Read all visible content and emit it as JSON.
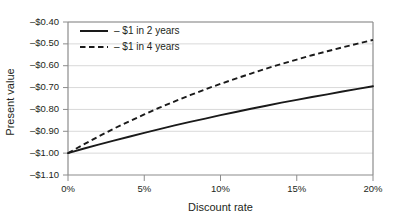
{
  "chart_data": {
    "type": "line",
    "title": "",
    "xlabel": "Discount rate",
    "ylabel": "Present value",
    "xlim": [
      0,
      20
    ],
    "ylim": [
      -1.1,
      -0.4
    ],
    "grid": true,
    "legend_position": "top-left",
    "xticks": [
      0,
      5,
      10,
      15,
      20
    ],
    "xticklabels": [
      "0%",
      "5%",
      "10%",
      "15%",
      "20%"
    ],
    "yticks": [
      -0.4,
      -0.5,
      -0.6,
      -0.7,
      -0.8,
      -0.9,
      -1.0,
      -1.1
    ],
    "yticklabels": [
      "–$0.40",
      "–$0.50",
      "–$0.60",
      "–$0.70",
      "–$0.80",
      "–$0.90",
      "–$1.00",
      "–$1.10"
    ],
    "x": [
      0,
      1,
      2,
      3,
      4,
      5,
      6,
      7,
      8,
      9,
      10,
      11,
      12,
      13,
      14,
      15,
      16,
      17,
      18,
      19,
      20
    ],
    "series": [
      {
        "name": "– $1 in 2 years",
        "style": "solid",
        "color": "#1a1a1a",
        "values": [
          -1.0,
          -0.98,
          -0.961,
          -0.943,
          -0.925,
          -0.907,
          -0.89,
          -0.873,
          -0.857,
          -0.842,
          -0.826,
          -0.812,
          -0.797,
          -0.783,
          -0.769,
          -0.756,
          -0.743,
          -0.731,
          -0.718,
          -0.706,
          -0.694
        ]
      },
      {
        "name": "– $1 in 4 years",
        "style": "dashed",
        "color": "#1a1a1a",
        "values": [
          -1.0,
          -0.961,
          -0.924,
          -0.888,
          -0.855,
          -0.823,
          -0.792,
          -0.763,
          -0.735,
          -0.708,
          -0.683,
          -0.659,
          -0.636,
          -0.613,
          -0.592,
          -0.572,
          -0.552,
          -0.534,
          -0.516,
          -0.499,
          -0.482
        ]
      }
    ]
  },
  "legend": {
    "items": [
      {
        "label": "– $1 in 2 years",
        "style": "solid"
      },
      {
        "label": "– $1 in 4 years",
        "style": "dashed"
      }
    ]
  },
  "axes": {
    "x_title": "Discount rate",
    "y_title": "Present value"
  },
  "colors": {
    "background": "#ffffff",
    "line": "#1a1a1a",
    "grid": "#d9d9d9",
    "axis": "#8c8c8c",
    "text": "#231f20"
  }
}
